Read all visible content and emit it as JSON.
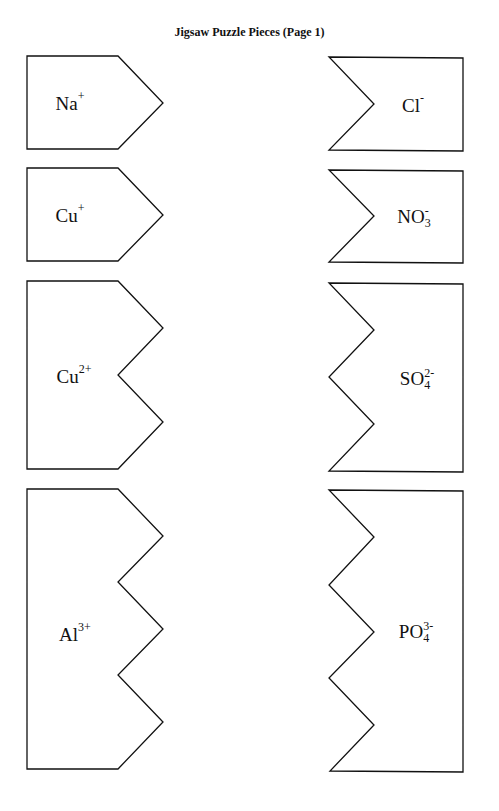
{
  "title": "Jigsaw Puzzle Pieces (Page 1)",
  "pieces": {
    "cations": [
      {
        "symbol": "Na",
        "charge": "+",
        "teeth": 1
      },
      {
        "symbol": "Cu",
        "charge": "+",
        "teeth": 1
      },
      {
        "symbol": "Cu",
        "charge": "2+",
        "teeth": 2
      },
      {
        "symbol": "Al",
        "charge": "3+",
        "teeth": 3
      }
    ],
    "anions": [
      {
        "symbol": "Cl",
        "charge": "-",
        "subscript": "",
        "notches": 1
      },
      {
        "symbol": "NO",
        "charge": "-",
        "subscript": "3",
        "notches": 1
      },
      {
        "symbol": "SO",
        "charge": "2-",
        "subscript": "4",
        "notches": 2
      },
      {
        "symbol": "PO",
        "charge": "3-",
        "subscript": "4",
        "notches": 3
      }
    ]
  }
}
